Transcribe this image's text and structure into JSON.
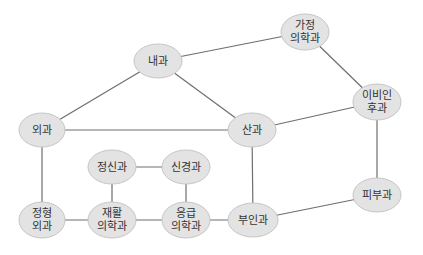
{
  "diagram": {
    "type": "network-graph",
    "node_fill": "#e3e3e3",
    "node_stroke": "#c6c6c6",
    "edge_color": "#6e6e6e",
    "text_color": "#333333",
    "nodes": [
      {
        "id": "naegwa",
        "lines": [
          "내과"
        ],
        "cx": 158,
        "cy": 61,
        "rx": 24,
        "ry": 17
      },
      {
        "id": "gajeong",
        "lines": [
          "가정",
          "의학과"
        ],
        "cx": 305,
        "cy": 32,
        "rx": 24,
        "ry": 18
      },
      {
        "id": "ibiinhu",
        "lines": [
          "이비인",
          "후과"
        ],
        "cx": 377,
        "cy": 102,
        "rx": 24,
        "ry": 18
      },
      {
        "id": "oegwa",
        "lines": [
          "외과"
        ],
        "cx": 42,
        "cy": 130,
        "rx": 23,
        "ry": 17
      },
      {
        "id": "sangwa",
        "lines": [
          "산과"
        ],
        "cx": 252,
        "cy": 130,
        "rx": 24,
        "ry": 17
      },
      {
        "id": "jeongsin",
        "lines": [
          "정신과"
        ],
        "cx": 112,
        "cy": 167,
        "rx": 24,
        "ry": 17
      },
      {
        "id": "singyeong",
        "lines": [
          "신경과"
        ],
        "cx": 186,
        "cy": 167,
        "rx": 24,
        "ry": 17
      },
      {
        "id": "jeonghyeong",
        "lines": [
          "정형",
          "외과"
        ],
        "cx": 42,
        "cy": 220,
        "rx": 23,
        "ry": 18
      },
      {
        "id": "jaehwal",
        "lines": [
          "재활",
          "의학과"
        ],
        "cx": 112,
        "cy": 220,
        "rx": 24,
        "ry": 18
      },
      {
        "id": "eunggeup",
        "lines": [
          "응급",
          "의학과"
        ],
        "cx": 186,
        "cy": 220,
        "rx": 24,
        "ry": 18
      },
      {
        "id": "buingwa",
        "lines": [
          "부인과"
        ],
        "cx": 253,
        "cy": 220,
        "rx": 25,
        "ry": 17
      },
      {
        "id": "pibu",
        "lines": [
          "피부과"
        ],
        "cx": 377,
        "cy": 195,
        "rx": 24,
        "ry": 17
      }
    ],
    "edges": [
      {
        "from": "naegwa",
        "to": "gajeong"
      },
      {
        "from": "naegwa",
        "to": "oegwa"
      },
      {
        "from": "naegwa",
        "to": "sangwa"
      },
      {
        "from": "gajeong",
        "to": "ibiinhu"
      },
      {
        "from": "ibiinhu",
        "to": "sangwa"
      },
      {
        "from": "ibiinhu",
        "to": "pibu"
      },
      {
        "from": "oegwa",
        "to": "sangwa"
      },
      {
        "from": "oegwa",
        "to": "jeonghyeong"
      },
      {
        "from": "sangwa",
        "to": "buingwa"
      },
      {
        "from": "jeongsin",
        "to": "singyeong"
      },
      {
        "from": "jeongsin",
        "to": "jaehwal"
      },
      {
        "from": "singyeong",
        "to": "eunggeup"
      },
      {
        "from": "jeonghyeong",
        "to": "jaehwal"
      },
      {
        "from": "jaehwal",
        "to": "eunggeup"
      },
      {
        "from": "eunggeup",
        "to": "buingwa"
      },
      {
        "from": "buingwa",
        "to": "pibu"
      }
    ]
  }
}
